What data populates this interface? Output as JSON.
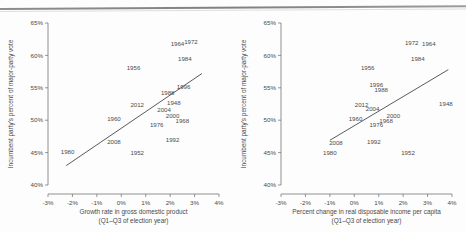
{
  "figure": {
    "background_color": "#fdfdfd",
    "ink_color": "#4a4a4a",
    "panel_count": 2
  },
  "chart_data": [
    {
      "type": "scatter",
      "id": "gdp-panel",
      "title": "",
      "xlabel": "Growth rate in gross domestic product",
      "xlabel_line2": "(Q1–Q3 of election year)",
      "ylabel": "Incumbent party's percent of major-party vote",
      "xlim": [
        -3,
        4
      ],
      "ylim": [
        40,
        65
      ],
      "xticks": [
        -3,
        -2,
        -1,
        0,
        1,
        2,
        3,
        4
      ],
      "xtick_labels": [
        "-3%",
        "-2%",
        "-1%",
        "0%",
        "1%",
        "2%",
        "3%",
        "4%"
      ],
      "yticks": [
        40,
        45,
        50,
        55,
        60,
        65
      ],
      "ytick_labels": [
        "40%",
        "45%",
        "50%",
        "55%",
        "60%",
        "65%"
      ],
      "grid": false,
      "legend": "none",
      "marker_style": "text-label",
      "points": [
        {
          "label": "1948",
          "x": 2.15,
          "y": 52.4
        },
        {
          "label": "1952",
          "x": 0.65,
          "y": 44.6
        },
        {
          "label": "1956",
          "x": 0.5,
          "y": 57.8
        },
        {
          "label": "1960",
          "x": -0.3,
          "y": 49.9
        },
        {
          "label": "1964",
          "x": 2.3,
          "y": 61.4
        },
        {
          "label": "1968",
          "x": 2.5,
          "y": 49.6
        },
        {
          "label": "1972",
          "x": 2.85,
          "y": 61.8
        },
        {
          "label": "1976",
          "x": 1.45,
          "y": 48.9
        },
        {
          "label": "1980",
          "x": -2.2,
          "y": 44.8
        },
        {
          "label": "1984",
          "x": 2.6,
          "y": 59.2
        },
        {
          "label": "1988",
          "x": 1.9,
          "y": 53.9
        },
        {
          "label": "1992",
          "x": 2.1,
          "y": 46.6
        },
        {
          "label": "1996",
          "x": 2.55,
          "y": 54.8
        },
        {
          "label": "2000",
          "x": 2.1,
          "y": 50.3
        },
        {
          "label": "2004",
          "x": 1.75,
          "y": 51.2
        },
        {
          "label": "2008",
          "x": -0.3,
          "y": 46.3
        },
        {
          "label": "2012",
          "x": 0.65,
          "y": 52.0
        }
      ],
      "fit_line": {
        "x0": -2.25,
        "y0": 43.0,
        "x1": 3.3,
        "y1": 57.2
      }
    },
    {
      "type": "scatter",
      "id": "income-panel",
      "title": "",
      "xlabel": "Percent change in real disposable income per capita",
      "xlabel_line2": "(Q1–Q3 of election year)",
      "ylabel": "Incumbent party's percent of major-party vote",
      "xlim": [
        -3,
        4
      ],
      "ylim": [
        40,
        65
      ],
      "xticks": [
        -3,
        -2,
        -1,
        0,
        1,
        2,
        3,
        4
      ],
      "xtick_labels": [
        "-3%",
        "-2%",
        "-1%",
        "0%",
        "1%",
        "2%",
        "3%",
        "4%"
      ],
      "yticks": [
        40,
        45,
        50,
        55,
        60,
        65
      ],
      "ytick_labels": [
        "40%",
        "45%",
        "50%",
        "55%",
        "60%",
        "65%"
      ],
      "grid": false,
      "legend": "none",
      "marker_style": "text-label",
      "points": [
        {
          "label": "1948",
          "x": 3.75,
          "y": 52.2
        },
        {
          "label": "1952",
          "x": 2.2,
          "y": 44.6
        },
        {
          "label": "1956",
          "x": 0.55,
          "y": 57.8
        },
        {
          "label": "1960",
          "x": 0.05,
          "y": 49.9
        },
        {
          "label": "1964",
          "x": 3.05,
          "y": 61.5
        },
        {
          "label": "1968",
          "x": 1.3,
          "y": 49.5
        },
        {
          "label": "1972",
          "x": 2.35,
          "y": 61.6
        },
        {
          "label": "1976",
          "x": 0.9,
          "y": 48.9
        },
        {
          "label": "1980",
          "x": -1.0,
          "y": 44.7
        },
        {
          "label": "1984",
          "x": 2.6,
          "y": 59.2
        },
        {
          "label": "1988",
          "x": 1.1,
          "y": 54.3
        },
        {
          "label": "1992",
          "x": 0.8,
          "y": 46.3
        },
        {
          "label": "1996",
          "x": 0.9,
          "y": 55.1
        },
        {
          "label": "2000",
          "x": 1.6,
          "y": 50.3
        },
        {
          "label": "2004",
          "x": 0.75,
          "y": 51.4
        },
        {
          "label": "2008",
          "x": -0.75,
          "y": 46.1
        },
        {
          "label": "2012",
          "x": 0.3,
          "y": 52.0
        }
      ],
      "fit_line": {
        "x0": -1.0,
        "y0": 46.9,
        "x1": 3.85,
        "y1": 57.8
      }
    }
  ],
  "panels": {
    "left": {
      "name": "gdp-scatter",
      "axis_title_x_line1": "Growth rate in gross domestic product",
      "axis_title_x_line2": "(Q1–Q3 of election year)",
      "axis_title_y": "Incumbent party's percent of major-party vote"
    },
    "right": {
      "name": "income-scatter",
      "axis_title_x_line1": "Percent change in real disposable income per capita",
      "axis_title_x_line2": "(Q1–Q3 of election year)",
      "axis_title_y": "Incumbent party's percent of major-party vote"
    }
  }
}
